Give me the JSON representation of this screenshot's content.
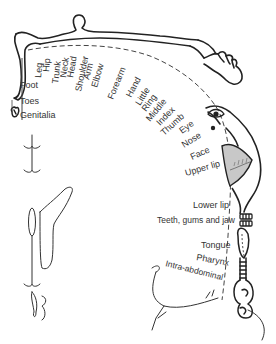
{
  "colors": {
    "line": "#222222",
    "text": "#333333",
    "lip_fill": "#c8c8c8",
    "background": "#ffffff"
  },
  "labels": {
    "leg": "Leg",
    "hip": "Hip",
    "trunk": "Trunk",
    "neck": "Neck",
    "head": "Head",
    "shoulder": "Shoulder",
    "arm": "Arm",
    "elbow": "Elbow",
    "forearm": "Forearm",
    "hand": "Hand",
    "little": "Little",
    "ring": "Ring",
    "middle": "Middle",
    "index": "Index",
    "thumb": "Thumb",
    "eye": "Eye",
    "nose": "Nose",
    "face": "Face",
    "upper_lip": "Upper lip",
    "lower_lip": "Lower lip",
    "teeth": "Teeth, gums and jaw",
    "tongue": "Tongue",
    "pharynx": "Pharynx",
    "intra_abdominal": "Intra-abdominal",
    "foot": "Foot",
    "toes": "Toes",
    "genitalia": "Genitalia"
  },
  "icons": [
    "body-figure",
    "hand-figure",
    "face-figure",
    "lips",
    "teeth",
    "tongue",
    "pharynx",
    "foot",
    "genitalia",
    "brain-section"
  ]
}
